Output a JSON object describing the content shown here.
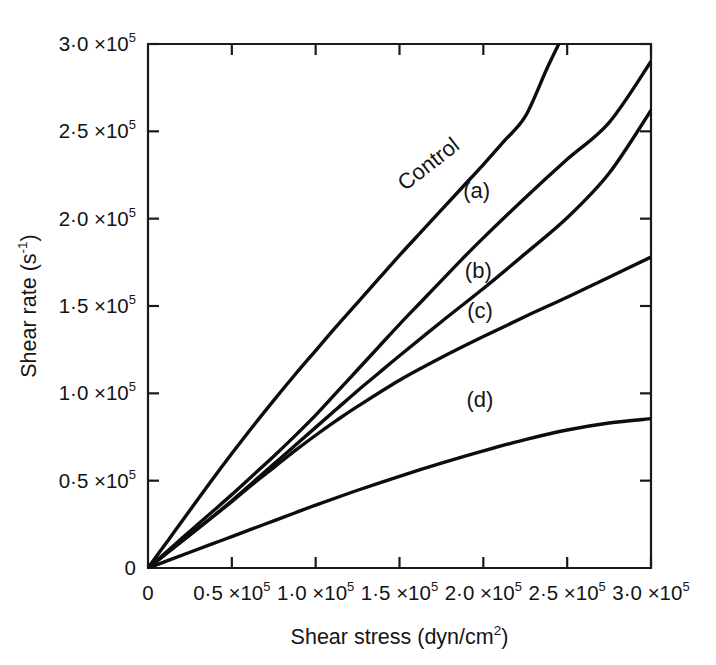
{
  "figure": {
    "background_color": "#ffffff",
    "ink_color": "#111111"
  },
  "chart_data": {
    "type": "line",
    "title": "",
    "subtitle": "",
    "xlabel": "Shear stress (dyn/cm2)",
    "xlabel_base": "Shear stress (dyn/cm",
    "xlabel_exp": "2",
    "xlabel_tail": ")",
    "ylabel": "Shear rate (s-1)",
    "ylabel_base": "Shear rate (s",
    "ylabel_exp": "-1",
    "ylabel_tail": ")",
    "xlim": [
      0,
      300000
    ],
    "ylim": [
      0,
      300000
    ],
    "grid": false,
    "legend_position": "inline-curve-labels",
    "x_tick_values": [
      0,
      50000,
      100000,
      150000,
      200000,
      250000,
      300000
    ],
    "y_tick_values": [
      0,
      50000,
      100000,
      150000,
      200000,
      250000,
      300000
    ],
    "x_tick_labels": [
      {
        "mantissa": "0",
        "exponent": ""
      },
      {
        "mantissa": "0·5 ×10",
        "exponent": "5"
      },
      {
        "mantissa": "1·0 ×10",
        "exponent": "5"
      },
      {
        "mantissa": "1·5 ×10",
        "exponent": "5"
      },
      {
        "mantissa": "2·0 ×10",
        "exponent": "5"
      },
      {
        "mantissa": "2·5 ×10",
        "exponent": "5"
      },
      {
        "mantissa": "3·0 ×10",
        "exponent": "5"
      }
    ],
    "y_tick_labels": [
      {
        "mantissa": "0",
        "exponent": ""
      },
      {
        "mantissa": "0·5 ×10",
        "exponent": "5"
      },
      {
        "mantissa": "1·0 ×10",
        "exponent": "5"
      },
      {
        "mantissa": "1·5 ×10",
        "exponent": "5"
      },
      {
        "mantissa": "2·0 ×10",
        "exponent": "5"
      },
      {
        "mantissa": "2·5 ×10",
        "exponent": "5"
      },
      {
        "mantissa": "3·0 ×10",
        "exponent": "5"
      }
    ],
    "series": [
      {
        "name": "Control",
        "label": "Control",
        "label_rotation_deg": -38,
        "label_x": 170000,
        "label_y": 228000,
        "x": [
          0,
          12500,
          25000,
          37500,
          50000,
          62500,
          75000,
          87500,
          100000,
          112500,
          125000,
          137500,
          150000,
          162500,
          175000,
          187500,
          200000,
          212500,
          225000,
          237500,
          245000
        ],
        "y": [
          0,
          16500,
          33000,
          49500,
          65500,
          81000,
          96000,
          110500,
          124500,
          138500,
          152000,
          165500,
          179000,
          192000,
          205000,
          218000,
          231000,
          244500,
          258500,
          285000,
          300000
        ]
      },
      {
        "name": "(a)",
        "label": "(a)",
        "label_rotation_deg": 0,
        "label_x": 196000,
        "label_y": 212000,
        "x": [
          0,
          12500,
          25000,
          37500,
          50000,
          62500,
          75000,
          87500,
          100000,
          112500,
          125000,
          137500,
          150000,
          162500,
          175000,
          187500,
          200000,
          225000,
          250000,
          275000,
          300000
        ],
        "y": [
          0,
          10500,
          21000,
          31500,
          42000,
          53000,
          64000,
          75500,
          87500,
          100500,
          113500,
          126500,
          139500,
          152000,
          164500,
          177000,
          189000,
          212000,
          234000,
          255000,
          290000
        ]
      },
      {
        "name": "(b)",
        "label": "(b)",
        "label_rotation_deg": 0,
        "label_x": 197000,
        "label_y": 166000,
        "x": [
          0,
          12500,
          25000,
          37500,
          50000,
          62500,
          75000,
          87500,
          100000,
          112500,
          125000,
          137500,
          150000,
          175000,
          200000,
          225000,
          250000,
          275000,
          300000
        ],
        "y": [
          0,
          9500,
          19000,
          28500,
          38500,
          49000,
          59500,
          70000,
          80500,
          91000,
          101500,
          111500,
          121500,
          141000,
          160000,
          180000,
          200500,
          226000,
          262000
        ]
      },
      {
        "name": "(c)",
        "label": "(c)",
        "label_rotation_deg": 0,
        "label_x": 198000,
        "label_y": 143000,
        "x": [
          0,
          12500,
          25000,
          37500,
          50000,
          62500,
          75000,
          87500,
          100000,
          112500,
          125000,
          150000,
          175000,
          200000,
          225000,
          250000,
          275000,
          300000
        ],
        "y": [
          0,
          9500,
          19000,
          28500,
          38000,
          48000,
          57500,
          67000,
          76000,
          84500,
          92500,
          107500,
          120500,
          132500,
          144000,
          155000,
          166500,
          178000
        ]
      },
      {
        "name": "(d)",
        "label": "(d)",
        "label_rotation_deg": 0,
        "label_x": 198000,
        "label_y": 92000,
        "x": [
          0,
          12500,
          25000,
          37500,
          50000,
          62500,
          75000,
          87500,
          100000,
          125000,
          150000,
          175000,
          200000,
          225000,
          250000,
          275000,
          300000
        ],
        "y": [
          0,
          4500,
          9000,
          13500,
          18000,
          22500,
          27000,
          31500,
          36000,
          44500,
          52500,
          60000,
          67000,
          73500,
          79000,
          83000,
          85500
        ]
      }
    ]
  }
}
